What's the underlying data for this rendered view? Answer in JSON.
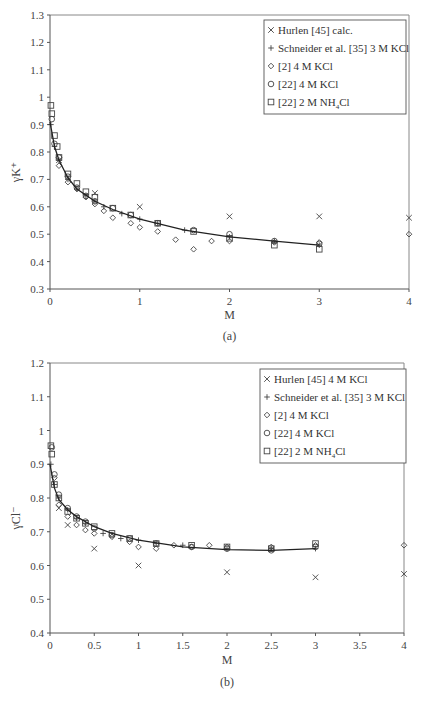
{
  "chart_data": [
    {
      "type": "scatter",
      "panel_label": "(a)",
      "title": "",
      "xlabel": "M",
      "ylabel": "γK⁺",
      "xlim": [
        0,
        4
      ],
      "ylim": [
        0.3,
        1.3
      ],
      "xticks": [
        "0",
        "1",
        "2",
        "3",
        "4"
      ],
      "yticks": [
        "0.3",
        "0.4",
        "0.5",
        "0.6",
        "0.7",
        "0.8",
        "0.9",
        "1",
        "1.1",
        "1.2",
        "1.3"
      ],
      "grid": false,
      "legend_position": "upper right",
      "legend": [
        {
          "marker": "×",
          "label": "Hurlen [45] calc."
        },
        {
          "marker": "+",
          "label": "Schneider et al. [35] 3 M KCl"
        },
        {
          "marker": "◇",
          "label": "[2] 4 M KCl"
        },
        {
          "marker": "○",
          "label": "[22] 4 M KCl"
        },
        {
          "marker": "□",
          "label": "[22] 2 M NH4Cl"
        }
      ],
      "series": [
        {
          "name": "Hurlen [45] calc.",
          "marker": "x",
          "x": [
            0.1,
            0.2,
            0.5,
            1.0,
            2.0,
            3.0,
            4.0
          ],
          "y": [
            0.77,
            0.71,
            0.65,
            0.6,
            0.565,
            0.565,
            0.56
          ]
        },
        {
          "name": "Schneider et al. [35] 3 M KCl",
          "marker": "+",
          "x": [
            0.01,
            0.05,
            0.1,
            0.2,
            0.3,
            0.4,
            0.5,
            0.6,
            0.8,
            1.0,
            1.2,
            1.5,
            2.0,
            2.5,
            3.0
          ],
          "y": [
            0.9,
            0.82,
            0.77,
            0.7,
            0.665,
            0.64,
            0.62,
            0.6,
            0.575,
            0.555,
            0.54,
            0.515,
            0.49,
            0.475,
            0.46
          ]
        },
        {
          "name": "[2] 4 M KCl",
          "marker": "diamond",
          "x": [
            0.1,
            0.2,
            0.3,
            0.4,
            0.5,
            0.6,
            0.7,
            0.9,
            1.0,
            1.2,
            1.4,
            1.6,
            1.8,
            2.0,
            2.5,
            3.0,
            4.0
          ],
          "y": [
            0.75,
            0.69,
            0.665,
            0.635,
            0.61,
            0.585,
            0.56,
            0.54,
            0.525,
            0.51,
            0.48,
            0.445,
            0.475,
            0.475,
            0.47,
            0.47,
            0.5
          ]
        },
        {
          "name": "[22] 4 M KCl",
          "marker": "circle",
          "x": [
            0.02,
            0.05,
            0.1,
            0.2,
            0.3,
            0.4,
            0.5,
            0.7,
            0.9,
            1.2,
            1.6,
            2.0,
            2.5,
            3.0
          ],
          "y": [
            0.92,
            0.83,
            0.78,
            0.71,
            0.67,
            0.64,
            0.62,
            0.595,
            0.57,
            0.54,
            0.515,
            0.5,
            0.475,
            0.465
          ]
        },
        {
          "name": "[22] 2 M NH4Cl",
          "marker": "square",
          "x": [
            0.01,
            0.02,
            0.05,
            0.08,
            0.1,
            0.2,
            0.3,
            0.4,
            0.5,
            0.7,
            0.9,
            1.2,
            1.6,
            2.0,
            2.5,
            3.0
          ],
          "y": [
            0.97,
            0.94,
            0.86,
            0.82,
            0.78,
            0.72,
            0.685,
            0.655,
            0.635,
            0.595,
            0.57,
            0.54,
            0.51,
            0.485,
            0.46,
            0.445
          ]
        },
        {
          "name": "fit",
          "marker": "line",
          "x": [
            0,
            0.05,
            0.1,
            0.2,
            0.3,
            0.5,
            0.7,
            1.0,
            1.5,
            2.0,
            2.5,
            3.0
          ],
          "y": [
            0.91,
            0.82,
            0.77,
            0.705,
            0.665,
            0.62,
            0.59,
            0.555,
            0.515,
            0.49,
            0.475,
            0.46
          ]
        }
      ]
    },
    {
      "type": "scatter",
      "panel_label": "(b)",
      "title": "",
      "xlabel": "M",
      "ylabel": "γCl⁻",
      "xlim": [
        0,
        4
      ],
      "ylim": [
        0.4,
        1.2
      ],
      "xticks": [
        "0",
        "0.5",
        "1",
        "1.5",
        "2",
        "2.5",
        "3",
        "3.5",
        "4"
      ],
      "yticks": [
        "0.4",
        "0.5",
        "0.6",
        "0.7",
        "0.8",
        "0.9",
        "1",
        "1.1",
        "1.2"
      ],
      "grid": false,
      "legend_position": "upper right",
      "legend": [
        {
          "marker": "×",
          "label": "Hurlen [45] 4 M KCl"
        },
        {
          "marker": "+",
          "label": "Schneider et al. [35] 3 M KCl"
        },
        {
          "marker": "◇",
          "label": "[2] 4 M KCl"
        },
        {
          "marker": "○",
          "label": "[22] 4 M KCl"
        },
        {
          "marker": "□",
          "label": "[22] 2 M NH4Cl"
        }
      ],
      "series": [
        {
          "name": "Hurlen [45] 4 M KCl",
          "marker": "x",
          "x": [
            0.1,
            0.2,
            0.5,
            1.0,
            2.0,
            3.0,
            4.0
          ],
          "y": [
            0.77,
            0.72,
            0.65,
            0.6,
            0.58,
            0.565,
            0.575
          ]
        },
        {
          "name": "Schneider et al. [35] 3 M KCl",
          "marker": "+",
          "x": [
            0.01,
            0.05,
            0.1,
            0.2,
            0.3,
            0.4,
            0.6,
            0.8,
            1.0,
            1.2,
            1.5,
            2.0,
            2.5,
            3.0
          ],
          "y": [
            0.9,
            0.84,
            0.8,
            0.765,
            0.74,
            0.725,
            0.695,
            0.68,
            0.675,
            0.665,
            0.66,
            0.65,
            0.65,
            0.65
          ]
        },
        {
          "name": "[2] 4 M KCl",
          "marker": "diamond",
          "x": [
            0.05,
            0.1,
            0.2,
            0.3,
            0.4,
            0.5,
            0.7,
            0.9,
            1.0,
            1.2,
            1.4,
            1.6,
            1.8,
            2.0,
            2.5,
            3.0,
            4.0
          ],
          "y": [
            0.86,
            0.78,
            0.745,
            0.72,
            0.705,
            0.695,
            0.685,
            0.67,
            0.655,
            0.65,
            0.66,
            0.655,
            0.66,
            0.655,
            0.655,
            0.66,
            0.66
          ]
        },
        {
          "name": "[22] 4 M KCl",
          "marker": "circle",
          "x": [
            0.02,
            0.05,
            0.1,
            0.2,
            0.3,
            0.4,
            0.5,
            0.7,
            0.9,
            1.2,
            1.6,
            2.0,
            2.5,
            3.0
          ],
          "y": [
            0.95,
            0.87,
            0.81,
            0.77,
            0.745,
            0.73,
            0.71,
            0.69,
            0.68,
            0.665,
            0.655,
            0.65,
            0.645,
            0.655
          ]
        },
        {
          "name": "[22] 2 M NH4Cl",
          "marker": "square",
          "x": [
            0.01,
            0.02,
            0.05,
            0.1,
            0.2,
            0.3,
            0.4,
            0.5,
            0.7,
            0.9,
            1.2,
            1.6,
            2.0,
            2.5,
            3.0
          ],
          "y": [
            0.955,
            0.93,
            0.84,
            0.8,
            0.76,
            0.74,
            0.725,
            0.715,
            0.695,
            0.68,
            0.665,
            0.66,
            0.655,
            0.65,
            0.665
          ]
        },
        {
          "name": "fit",
          "marker": "line",
          "x": [
            0,
            0.05,
            0.1,
            0.2,
            0.3,
            0.5,
            0.7,
            1.0,
            1.5,
            2.0,
            2.5,
            3.0
          ],
          "y": [
            0.9,
            0.83,
            0.795,
            0.765,
            0.745,
            0.715,
            0.695,
            0.675,
            0.655,
            0.647,
            0.645,
            0.65
          ]
        }
      ]
    }
  ]
}
